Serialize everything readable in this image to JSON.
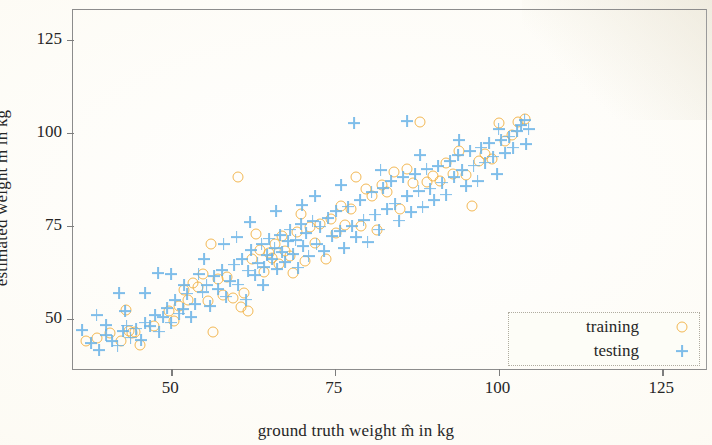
{
  "figure": {
    "background_color": "#fdfcf8",
    "frame_color": "#8c8c8c"
  },
  "chart_data": {
    "type": "scatter",
    "title": "",
    "xlabel": "ground truth weight m̂ in kg",
    "ylabel": "estimated weight m̃ in kg",
    "xlim": [
      35,
      132
    ],
    "ylim": [
      36,
      133
    ],
    "xticks": [
      50,
      75,
      100,
      125
    ],
    "xtick_labels": [
      "50",
      "75",
      "100",
      "125"
    ],
    "yticks": [
      50,
      75,
      100,
      125
    ],
    "ytick_labels": [
      "50",
      "75",
      "100",
      "125"
    ],
    "grid": false,
    "legend_position": "lower right",
    "legend_entries": [
      {
        "name": "training",
        "marker": "circle",
        "color": "#f0ab37"
      },
      {
        "name": "testing",
        "marker": "plus",
        "color": "#69b3e7"
      }
    ],
    "series": [
      {
        "name": "training",
        "marker": "circle",
        "color": "#f0ab37",
        "points": [
          [
            37.0,
            44.0
          ],
          [
            38.6,
            45.0
          ],
          [
            40.6,
            46.2
          ],
          [
            42.3,
            44.0
          ],
          [
            43.1,
            52.5
          ],
          [
            43.6,
            46.8
          ],
          [
            44.0,
            46.2
          ],
          [
            44.4,
            46.6
          ],
          [
            45.2,
            43.0
          ],
          [
            47.4,
            48.2
          ],
          [
            49.6,
            52.0
          ],
          [
            50.4,
            49.4
          ],
          [
            51.2,
            53.4
          ],
          [
            51.9,
            57.8
          ],
          [
            52.6,
            55.0
          ],
          [
            53.4,
            59.6
          ],
          [
            54.1,
            58.6
          ],
          [
            54.8,
            62.0
          ],
          [
            55.6,
            54.8
          ],
          [
            56.1,
            70.2
          ],
          [
            56.4,
            46.6
          ],
          [
            57.2,
            60.6
          ],
          [
            57.9,
            56.4
          ],
          [
            58.6,
            61.2
          ],
          [
            59.4,
            55.6
          ],
          [
            60.2,
            88.0
          ],
          [
            60.6,
            53.2
          ],
          [
            61.1,
            57.0
          ],
          [
            61.8,
            52.2
          ],
          [
            62.4,
            66.0
          ],
          [
            63.0,
            72.8
          ],
          [
            63.6,
            68.6
          ],
          [
            64.2,
            62.6
          ],
          [
            64.9,
            67.6
          ],
          [
            65.4,
            66.4
          ],
          [
            65.9,
            70.0
          ],
          [
            66.4,
            64.8
          ],
          [
            66.9,
            72.4
          ],
          [
            67.4,
            68.2
          ],
          [
            68.1,
            67.0
          ],
          [
            68.6,
            62.4
          ],
          [
            69.2,
            73.4
          ],
          [
            69.8,
            78.2
          ],
          [
            70.4,
            65.6
          ],
          [
            71.2,
            74.6
          ],
          [
            72.0,
            70.4
          ],
          [
            72.8,
            75.6
          ],
          [
            73.6,
            66.2
          ],
          [
            74.4,
            76.8
          ],
          [
            75.1,
            73.0
          ],
          [
            75.9,
            80.4
          ],
          [
            76.6,
            75.2
          ],
          [
            77.4,
            79.4
          ],
          [
            78.2,
            88.0
          ],
          [
            79.0,
            75.0
          ],
          [
            79.8,
            85.0
          ],
          [
            80.6,
            83.0
          ],
          [
            81.4,
            73.8
          ],
          [
            82.2,
            86.0
          ],
          [
            83.0,
            84.2
          ],
          [
            84.0,
            89.6
          ],
          [
            85.0,
            79.6
          ],
          [
            86.0,
            90.4
          ],
          [
            87.0,
            86.4
          ],
          [
            88.0,
            103.0
          ],
          [
            89.0,
            86.8
          ],
          [
            90.0,
            88.4
          ],
          [
            91.0,
            87.0
          ],
          [
            92.0,
            92.0
          ],
          [
            93.0,
            89.0
          ],
          [
            94.0,
            95.0
          ],
          [
            95.0,
            88.6
          ],
          [
            96.0,
            80.4
          ],
          [
            97.0,
            92.4
          ],
          [
            98.0,
            94.2
          ],
          [
            99.0,
            93.0
          ],
          [
            100.0,
            102.6
          ],
          [
            101.0,
            97.8
          ],
          [
            102.0,
            99.4
          ],
          [
            103.0,
            103.0
          ],
          [
            104.0,
            103.6
          ]
        ]
      },
      {
        "name": "testing",
        "marker": "plus",
        "color": "#69b3e7",
        "points": [
          [
            36.4,
            47.0
          ],
          [
            37.8,
            43.6
          ],
          [
            39.0,
            41.6
          ],
          [
            40.0,
            45.6
          ],
          [
            41.0,
            44.0
          ],
          [
            41.8,
            42.8
          ],
          [
            42.6,
            46.8
          ],
          [
            43.2,
            48.2
          ],
          [
            43.8,
            45.0
          ],
          [
            44.6,
            47.4
          ],
          [
            45.4,
            44.2
          ],
          [
            46.0,
            49.0
          ],
          [
            46.8,
            48.0
          ],
          [
            47.6,
            51.0
          ],
          [
            48.2,
            46.6
          ],
          [
            48.8,
            50.4
          ],
          [
            49.4,
            53.0
          ],
          [
            50.0,
            49.0
          ],
          [
            50.6,
            55.0
          ],
          [
            51.2,
            51.4
          ],
          [
            51.8,
            52.6
          ],
          [
            52.4,
            56.8
          ],
          [
            53.0,
            50.4
          ],
          [
            53.6,
            54.0
          ],
          [
            54.2,
            62.0
          ],
          [
            54.8,
            57.2
          ],
          [
            55.4,
            59.0
          ],
          [
            56.0,
            53.4
          ],
          [
            56.6,
            61.4
          ],
          [
            57.2,
            58.0
          ],
          [
            57.8,
            63.2
          ],
          [
            58.4,
            56.0
          ],
          [
            59.0,
            60.2
          ],
          [
            59.6,
            64.6
          ],
          [
            60.2,
            59.2
          ],
          [
            60.8,
            66.0
          ],
          [
            61.4,
            55.2
          ],
          [
            61.8,
            63.0
          ],
          [
            62.2,
            68.4
          ],
          [
            62.8,
            61.8
          ],
          [
            63.2,
            65.0
          ],
          [
            63.8,
            70.2
          ],
          [
            64.2,
            64.0
          ],
          [
            64.6,
            67.2
          ],
          [
            65.0,
            71.6
          ],
          [
            65.4,
            66.0
          ],
          [
            65.8,
            69.0
          ],
          [
            66.2,
            63.4
          ],
          [
            66.6,
            72.6
          ],
          [
            67.0,
            68.0
          ],
          [
            67.4,
            65.2
          ],
          [
            67.8,
            70.8
          ],
          [
            68.2,
            74.0
          ],
          [
            68.6,
            67.4
          ],
          [
            69.0,
            71.2
          ],
          [
            69.4,
            63.8
          ],
          [
            69.8,
            75.4
          ],
          [
            70.2,
            69.6
          ],
          [
            70.6,
            73.0
          ],
          [
            71.0,
            66.8
          ],
          [
            71.6,
            76.2
          ],
          [
            72.2,
            70.0
          ],
          [
            72.8,
            74.8
          ],
          [
            73.4,
            68.2
          ],
          [
            74.0,
            77.0
          ],
          [
            74.6,
            72.2
          ],
          [
            75.2,
            79.0
          ],
          [
            75.8,
            73.6
          ],
          [
            76.4,
            69.0
          ],
          [
            77.0,
            80.2
          ],
          [
            77.6,
            75.0
          ],
          [
            78.2,
            72.0
          ],
          [
            78.8,
            82.0
          ],
          [
            79.4,
            76.6
          ],
          [
            80.0,
            70.6
          ],
          [
            80.6,
            84.0
          ],
          [
            81.2,
            78.0
          ],
          [
            81.8,
            74.0
          ],
          [
            82.4,
            85.2
          ],
          [
            83.0,
            79.6
          ],
          [
            83.6,
            87.0
          ],
          [
            84.2,
            81.0
          ],
          [
            84.8,
            76.4
          ],
          [
            85.4,
            88.2
          ],
          [
            86.0,
            83.0
          ],
          [
            86.6,
            78.6
          ],
          [
            87.2,
            89.0
          ],
          [
            87.8,
            84.4
          ],
          [
            88.4,
            80.0
          ],
          [
            89.0,
            90.2
          ],
          [
            89.6,
            85.0
          ],
          [
            90.2,
            82.0
          ],
          [
            90.8,
            91.0
          ],
          [
            91.4,
            86.6
          ],
          [
            92.0,
            83.4
          ],
          [
            92.6,
            92.4
          ],
          [
            93.2,
            88.0
          ],
          [
            93.8,
            94.0
          ],
          [
            94.4,
            90.0
          ],
          [
            95.0,
            85.6
          ],
          [
            95.6,
            95.0
          ],
          [
            96.2,
            91.2
          ],
          [
            96.8,
            87.0
          ],
          [
            97.4,
            96.0
          ],
          [
            98.0,
            92.0
          ],
          [
            98.6,
            97.2
          ],
          [
            99.2,
            93.6
          ],
          [
            99.8,
            89.0
          ],
          [
            100.4,
            98.0
          ],
          [
            101.0,
            94.6
          ],
          [
            101.6,
            99.0
          ],
          [
            102.2,
            96.0
          ],
          [
            102.8,
            100.4
          ],
          [
            103.4,
            102.0
          ],
          [
            104.0,
            103.4
          ],
          [
            104.6,
            101.0
          ],
          [
            86.0,
            103.2
          ],
          [
            78.0,
            102.6
          ],
          [
            70.0,
            80.6
          ],
          [
            64.0,
            59.0
          ],
          [
            60.0,
            72.0
          ],
          [
            55.0,
            66.0
          ],
          [
            50.0,
            62.0
          ],
          [
            46.0,
            57.0
          ],
          [
            43.0,
            52.0
          ],
          [
            40.0,
            48.4
          ],
          [
            38.6,
            51.0
          ],
          [
            42.0,
            57.0
          ],
          [
            48.0,
            62.4
          ],
          [
            52.0,
            59.0
          ],
          [
            58.0,
            70.0
          ],
          [
            62.0,
            76.0
          ],
          [
            66.0,
            79.0
          ],
          [
            72.0,
            83.0
          ],
          [
            76.0,
            86.0
          ],
          [
            82.0,
            90.0
          ],
          [
            88.0,
            94.0
          ],
          [
            94.0,
            98.0
          ],
          [
            100.0,
            101.0
          ],
          [
            104.2,
            97.0
          ]
        ]
      }
    ]
  }
}
